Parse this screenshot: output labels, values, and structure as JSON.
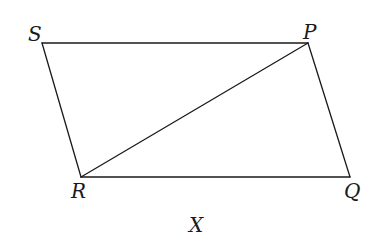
{
  "diagram": {
    "caption": "X",
    "vertices": {
      "S": {
        "label": "S",
        "x": 42,
        "y": 43,
        "lx": 28,
        "ly": 41
      },
      "P": {
        "label": "P",
        "x": 308,
        "y": 43,
        "lx": 303,
        "ly": 39
      },
      "R": {
        "label": "R",
        "x": 81,
        "y": 177,
        "lx": 71,
        "ly": 198
      },
      "Q": {
        "label": "Q",
        "x": 350,
        "y": 177,
        "lx": 344,
        "ly": 198
      }
    },
    "edges": [
      {
        "from": "S",
        "to": "P"
      },
      {
        "from": "P",
        "to": "Q"
      },
      {
        "from": "Q",
        "to": "R"
      },
      {
        "from": "R",
        "to": "S"
      },
      {
        "from": "R",
        "to": "P"
      }
    ],
    "caption_pos": {
      "x": 189,
      "y": 232
    },
    "stroke_color": "#1a1a1a",
    "background": "#ffffff"
  }
}
